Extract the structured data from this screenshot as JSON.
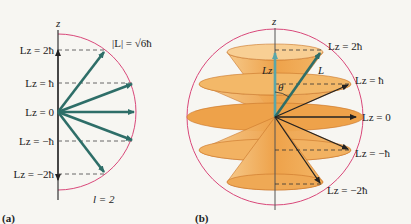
{
  "figure": {
    "panel_a": {
      "label": "(a)",
      "axis_label": "z",
      "magnitude_label": "|L| = √6ħ",
      "quantum_number_label": "l = 2",
      "levels": [
        {
          "label": "Lz = 2ħ",
          "m": 2
        },
        {
          "label": "Lz = ħ",
          "m": 1
        },
        {
          "label": "Lz = 0",
          "m": 0
        },
        {
          "label": "Lz = −ħ",
          "m": -1
        },
        {
          "label": "Lz = −2ħ",
          "m": -2
        }
      ]
    },
    "panel_b": {
      "label": "(b)",
      "axis_label": "z",
      "vector_label": "L",
      "component_label": "Lz",
      "angle_label": "θ",
      "levels": [
        {
          "label": "Lz = 2ħ",
          "m": 2
        },
        {
          "label": "Lz = ħ",
          "m": 1
        },
        {
          "label": "Lz = 0",
          "m": 0
        },
        {
          "label": "Lz = −ħ",
          "m": -1
        },
        {
          "label": "Lz = −2ħ",
          "m": -2
        }
      ]
    },
    "colors": {
      "vector": "#2e6e68",
      "highlight_vector": "#5aa6a8",
      "circle": "#d9487a",
      "cone_fill": "#f0a94a",
      "axis": "#333333",
      "dashed": "#333333"
    }
  }
}
